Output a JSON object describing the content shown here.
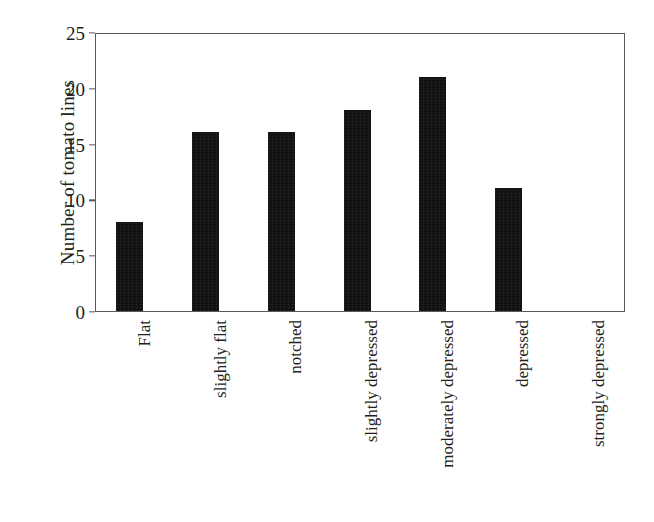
{
  "chart_data": {
    "type": "bar",
    "title": "",
    "xlabel": "",
    "ylabel": "Number of tomato lines",
    "categories": [
      "Flat",
      "slightly flat",
      "notched",
      "slightly depressed",
      "moderately depressed",
      "depressed",
      "strongly depressed"
    ],
    "values": [
      8,
      16,
      16,
      18,
      21,
      11,
      0
    ],
    "ylim": [
      0,
      25
    ],
    "yticks": [
      0,
      5,
      10,
      15,
      20,
      25
    ],
    "ytick_labels": [
      "0",
      "5",
      "10",
      "15",
      "20",
      "25"
    ],
    "grid": false,
    "legend": false,
    "bar_color": "#111111",
    "axis_color": "#595959",
    "background_color": "#ffffff",
    "text_color": "#231f20"
  }
}
